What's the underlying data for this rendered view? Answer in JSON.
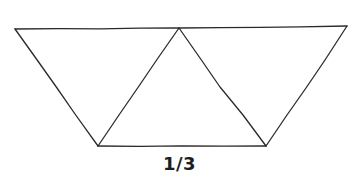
{
  "figure": {
    "caption": "1/3",
    "line_color": "#2a2a2a",
    "background": "#ffffff",
    "vertices": {
      "top_left": [
        15,
        29
      ],
      "top_middle": [
        179,
        28
      ],
      "top_right": [
        347,
        26
      ],
      "bottom_left": [
        98,
        146
      ],
      "bottom_right": [
        266,
        146
      ]
    },
    "triangles": [
      {
        "name": "left-triangle",
        "points": [
          "top_left",
          "top_middle",
          "bottom_left"
        ],
        "orientation": "down"
      },
      {
        "name": "middle-triangle",
        "points": [
          "top_middle",
          "bottom_left",
          "bottom_right"
        ],
        "orientation": "up"
      },
      {
        "name": "right-triangle",
        "points": [
          "top_middle",
          "top_right",
          "bottom_right"
        ],
        "orientation": "down"
      }
    ]
  }
}
